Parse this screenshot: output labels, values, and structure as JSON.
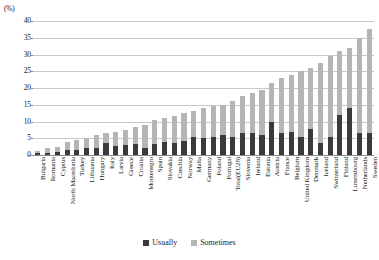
{
  "chart_data": {
    "type": "bar",
    "title": "",
    "subtitle": "",
    "xlabel": "",
    "ylabel": "(%)",
    "unit": "(%)",
    "ylim": [
      0,
      40
    ],
    "ytick_step": 5,
    "yticks": [
      "40",
      "35",
      "30",
      "25",
      "20",
      "15",
      "10",
      "5",
      "0"
    ],
    "grid": true,
    "stacked": true,
    "legend_position": "bottom",
    "categories": [
      "Bulgaria",
      "Romania",
      "Cyprus",
      "North Macedonia",
      "Turkey",
      "Lithuania",
      "Hungary",
      "Italy",
      "Latvia",
      "Greece",
      "Croatia",
      "Montenegro",
      "Spain",
      "Slovakia",
      "Czechia",
      "Norway",
      "Malta",
      "Germany",
      "Poland",
      "Portugal",
      "Total(EU28)",
      "Slovenia",
      "Ireland",
      "Estonia",
      "Austria",
      "France",
      "Belgium",
      "United Kingdom",
      "Denmark",
      "Iceland",
      "Switzerland",
      "Finland",
      "Luxembourg",
      "Netherlands",
      "Sweden"
    ],
    "series": [
      {
        "name": "Usually",
        "color": "#3a3a3a",
        "values": [
          0.5,
          0.6,
          1.0,
          1.6,
          1.4,
          2.0,
          2.1,
          3.5,
          2.7,
          3.0,
          3.3,
          2.0,
          3.3,
          4.0,
          3.5,
          4.2,
          5.5,
          5.0,
          5.3,
          6.0,
          5.4,
          6.5,
          6.5,
          6.0,
          10.0,
          6.5,
          7.0,
          5.5,
          7.8,
          3.5,
          5.5,
          12.0,
          14.0,
          6.5,
          6.5
        ]
      },
      {
        "name": "Sometimes",
        "color": "#b5b5b5",
        "values": [
          0.8,
          1.4,
          1.5,
          2.4,
          3.1,
          3.0,
          3.9,
          3.0,
          4.3,
          4.5,
          5.2,
          7.0,
          7.2,
          7.0,
          8.0,
          8.3,
          7.5,
          9.0,
          9.2,
          9.0,
          10.6,
          11.0,
          12.0,
          13.5,
          11.5,
          16.5,
          17.0,
          19.5,
          18.2,
          24.0,
          24.0,
          19.0,
          18.0,
          28.5,
          31.0
        ]
      }
    ],
    "totals": [
      1.3,
      2.0,
      2.5,
      4.0,
      4.5,
      5.0,
      6.0,
      6.5,
      7.0,
      7.5,
      8.5,
      9.0,
      10.5,
      11.0,
      11.5,
      12.5,
      13.0,
      14.0,
      14.5,
      15.0,
      16.0,
      17.5,
      18.5,
      19.5,
      21.5,
      23.0,
      24.0,
      25.0,
      26.0,
      27.5,
      29.5,
      31.0,
      32.0,
      35.0,
      37.5
    ]
  },
  "legend": {
    "items": [
      {
        "label": "Usually",
        "color": "#3a3a3a"
      },
      {
        "label": "Sometimes",
        "color": "#b5b5b5"
      }
    ]
  }
}
